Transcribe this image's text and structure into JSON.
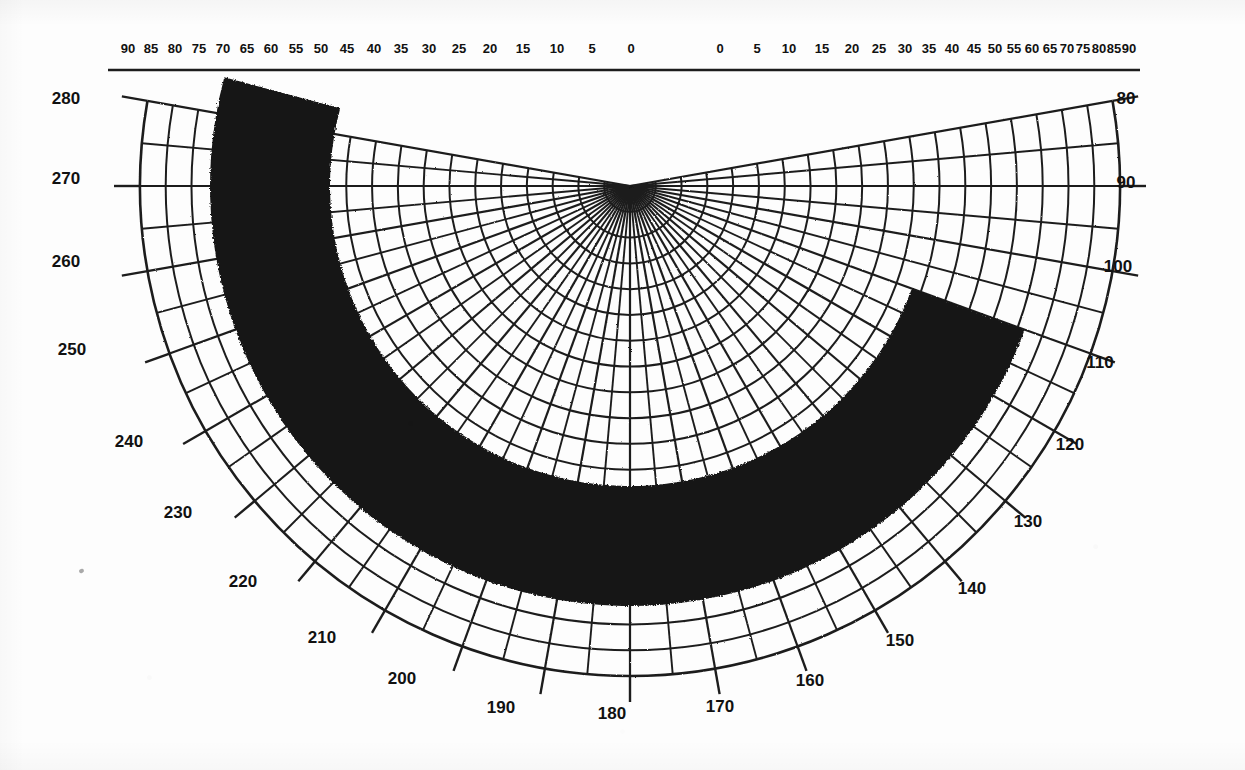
{
  "figure": {
    "kind": "polar-grid-chart",
    "background_color": "#fdfdfd",
    "ink_color": "#1a1a1a",
    "data_fill_color": "#151515"
  },
  "chart_data": {
    "type": "line",
    "title": "",
    "subtitle": "",
    "xlabel": "",
    "ylabel": "",
    "projection": "polar-half-plane",
    "grid": true,
    "legend": null,
    "pole": {
      "x": 630,
      "y": 186
    },
    "top_axis": {
      "label": "",
      "y_pixel": 70,
      "left_scale_ticks": [
        90,
        85,
        80,
        75,
        70,
        65,
        60,
        55,
        50,
        45,
        40,
        35,
        30,
        25,
        20,
        15,
        10,
        5,
        0
      ],
      "right_scale_ticks": [
        0,
        5,
        10,
        15,
        20,
        25,
        30,
        35,
        40,
        45,
        50,
        55,
        60,
        65,
        70,
        75,
        80,
        85,
        90
      ],
      "left_scale_x": [
        128,
        151,
        174,
        198,
        222,
        246,
        270,
        295,
        320,
        346,
        373,
        400,
        428,
        458,
        489,
        522,
        556,
        583,
        600
      ],
      "right_scale_x": [
        660,
        672,
        705,
        739,
        771,
        801,
        829,
        855,
        879,
        902,
        923,
        943,
        962,
        980,
        997,
        1013,
        1029,
        1044,
        1058
      ],
      "left_labels": [
        "90",
        "85",
        "80",
        "75",
        "70",
        "65",
        "60",
        "55",
        "50",
        "45",
        "40",
        "35",
        "30",
        "25",
        "20",
        "15",
        "10",
        "5",
        "0"
      ],
      "right_labels": [
        "0",
        "5",
        "10",
        "15",
        "20",
        "25",
        "30",
        "35",
        "40",
        "45",
        "50",
        "55",
        "60",
        "65",
        "70",
        "75",
        "80",
        "85",
        "90"
      ]
    },
    "angular_axis": {
      "label": "",
      "unit": "degrees",
      "range": [
        80,
        280
      ],
      "tick_step": 10,
      "minor_tick_step": 5,
      "ticks": [
        80,
        90,
        100,
        110,
        120,
        130,
        140,
        150,
        160,
        170,
        180,
        190,
        200,
        210,
        220,
        230,
        240,
        250,
        260,
        270,
        280
      ],
      "labels": [
        "80",
        "90",
        "100",
        "110",
        "120",
        "130",
        "140",
        "150",
        "160",
        "170",
        "180",
        "190",
        "200",
        "210",
        "220",
        "230",
        "240",
        "250",
        "260",
        "270",
        "280"
      ]
    },
    "radial_axis": {
      "label": "",
      "arc_count": 19,
      "arcs_visible": true
    },
    "series": [
      {
        "name": "shaded-region",
        "type": "filled-crescent-band",
        "fill": "#151515",
        "description": "thick black crescent-shaped annular band open toward the upper right",
        "outer_radius_px": 420,
        "inner_radius_px": 300,
        "start_angle_deg": 110,
        "end_angle_deg": 285
      }
    ]
  },
  "labels": {
    "top_left": [
      {
        "text": "90",
        "x": 128,
        "y": 48
      },
      {
        "text": "85",
        "x": 151,
        "y": 48
      },
      {
        "text": "80",
        "x": 175,
        "y": 48
      },
      {
        "text": "75",
        "x": 199,
        "y": 48
      },
      {
        "text": "70",
        "x": 223,
        "y": 48
      },
      {
        "text": "65",
        "x": 247,
        "y": 48
      },
      {
        "text": "60",
        "x": 271,
        "y": 48
      },
      {
        "text": "55",
        "x": 296,
        "y": 48
      },
      {
        "text": "50",
        "x": 321,
        "y": 48
      },
      {
        "text": "45",
        "x": 347,
        "y": 48
      },
      {
        "text": "40",
        "x": 374,
        "y": 48
      },
      {
        "text": "35",
        "x": 401,
        "y": 48
      },
      {
        "text": "30",
        "x": 429,
        "y": 48
      },
      {
        "text": "25",
        "x": 459,
        "y": 48
      },
      {
        "text": "20",
        "x": 490,
        "y": 48
      },
      {
        "text": "15",
        "x": 523,
        "y": 48
      },
      {
        "text": "10",
        "x": 557,
        "y": 48
      },
      {
        "text": "5",
        "x": 592,
        "y": 48
      },
      {
        "text": "0",
        "x": 631,
        "y": 48
      }
    ],
    "top_right": [
      {
        "text": "0",
        "x": 720,
        "y": 48
      },
      {
        "text": "5",
        "x": 757,
        "y": 48
      },
      {
        "text": "10",
        "x": 789,
        "y": 48
      },
      {
        "text": "15",
        "x": 822,
        "y": 48
      },
      {
        "text": "20",
        "x": 852,
        "y": 48
      },
      {
        "text": "25",
        "x": 879,
        "y": 48
      },
      {
        "text": "30",
        "x": 905,
        "y": 48
      },
      {
        "text": "35",
        "x": 929,
        "y": 48
      },
      {
        "text": "40",
        "x": 952,
        "y": 48
      },
      {
        "text": "45",
        "x": 974,
        "y": 48
      },
      {
        "text": "50",
        "x": 995,
        "y": 48
      },
      {
        "text": "55",
        "x": 1014,
        "y": 48
      },
      {
        "text": "60",
        "x": 1032,
        "y": 48
      },
      {
        "text": "65",
        "x": 1050,
        "y": 48
      },
      {
        "text": "70",
        "x": 1067,
        "y": 48
      },
      {
        "text": "75",
        "x": 1083,
        "y": 48
      },
      {
        "text": "80",
        "x": 1099,
        "y": 48
      },
      {
        "text": "85",
        "x": 1114,
        "y": 48
      },
      {
        "text": "90",
        "x": 1129,
        "y": 48
      }
    ],
    "angular": [
      {
        "text": "280",
        "x": 66,
        "y": 98
      },
      {
        "text": "270",
        "x": 66,
        "y": 178
      },
      {
        "text": "260",
        "x": 66,
        "y": 261
      },
      {
        "text": "250",
        "x": 72,
        "y": 349
      },
      {
        "text": "240",
        "x": 129,
        "y": 441
      },
      {
        "text": "230",
        "x": 178,
        "y": 512
      },
      {
        "text": "220",
        "x": 243,
        "y": 581
      },
      {
        "text": "210",
        "x": 322,
        "y": 637
      },
      {
        "text": "200",
        "x": 402,
        "y": 678
      },
      {
        "text": "190",
        "x": 501,
        "y": 707
      },
      {
        "text": "180",
        "x": 612,
        "y": 713
      },
      {
        "text": "170",
        "x": 720,
        "y": 706
      },
      {
        "text": "160",
        "x": 810,
        "y": 680
      },
      {
        "text": "150",
        "x": 900,
        "y": 640
      },
      {
        "text": "140",
        "x": 972,
        "y": 588
      },
      {
        "text": "130",
        "x": 1028,
        "y": 521
      },
      {
        "text": "120",
        "x": 1070,
        "y": 444
      },
      {
        "text": "110",
        "x": 1100,
        "y": 362
      },
      {
        "text": "100",
        "x": 1118,
        "y": 266
      },
      {
        "text": "90",
        "x": 1126,
        "y": 182
      },
      {
        "text": "80",
        "x": 1126,
        "y": 98
      }
    ]
  },
  "artifacts": {
    "speck": {
      "x": 79,
      "y": 569
    }
  }
}
